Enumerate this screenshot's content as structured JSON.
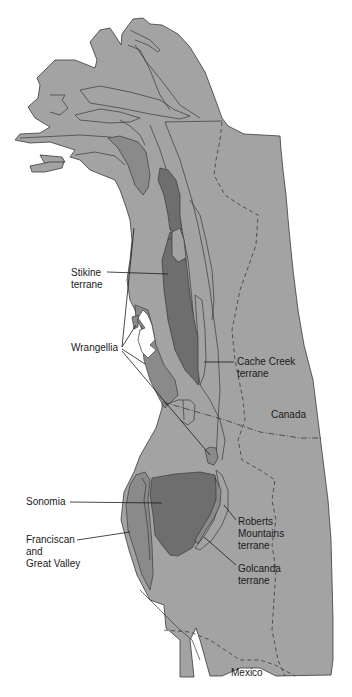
{
  "map": {
    "type": "geologic-terrane-map",
    "region": "Western North American Cordillera",
    "colors": {
      "background": "#ffffff",
      "land": "#a3a3a3",
      "terrane_medium": "#8a8a8a",
      "terrane_dark": "#6e6e6e",
      "outline": "#3a3a3a",
      "text": "#1a1a1a"
    },
    "labels": {
      "stikine": "Stikine\nterrane",
      "wrangellia": "Wrangellia",
      "cache_creek": "Cache Creek\nterrane",
      "canada": "Canada",
      "sonomia": "Sonomia",
      "franciscan": "Franciscan\nand\nGreat Valley",
      "roberts": "Roberts\nMountains\nterrane",
      "golcanda": "Golcanda\nterrane",
      "mexico": "Mexico"
    }
  }
}
